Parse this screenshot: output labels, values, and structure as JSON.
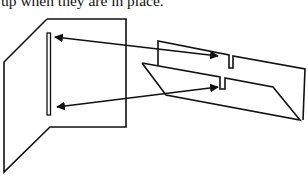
{
  "caption": {
    "text": "up when they are in place."
  },
  "diagram": {
    "stroke_color": "#111111",
    "background": "#ffffff",
    "parts": [
      {
        "id": "front-panel",
        "description": "Upright folded panel with vertical slot"
      },
      {
        "id": "slot",
        "description": "Long vertical slot in front panel"
      },
      {
        "id": "back-panel",
        "description": "Slanted upright rear panel with upper notch"
      },
      {
        "id": "base-panel",
        "description": "Tilted base/parallelogram with lower notch"
      },
      {
        "id": "upper-arrow",
        "description": "Double-headed arrow linking top of slot to upper notch"
      },
      {
        "id": "lower-arrow",
        "description": "Double-headed arrow linking bottom of slot to lower notch"
      }
    ]
  }
}
